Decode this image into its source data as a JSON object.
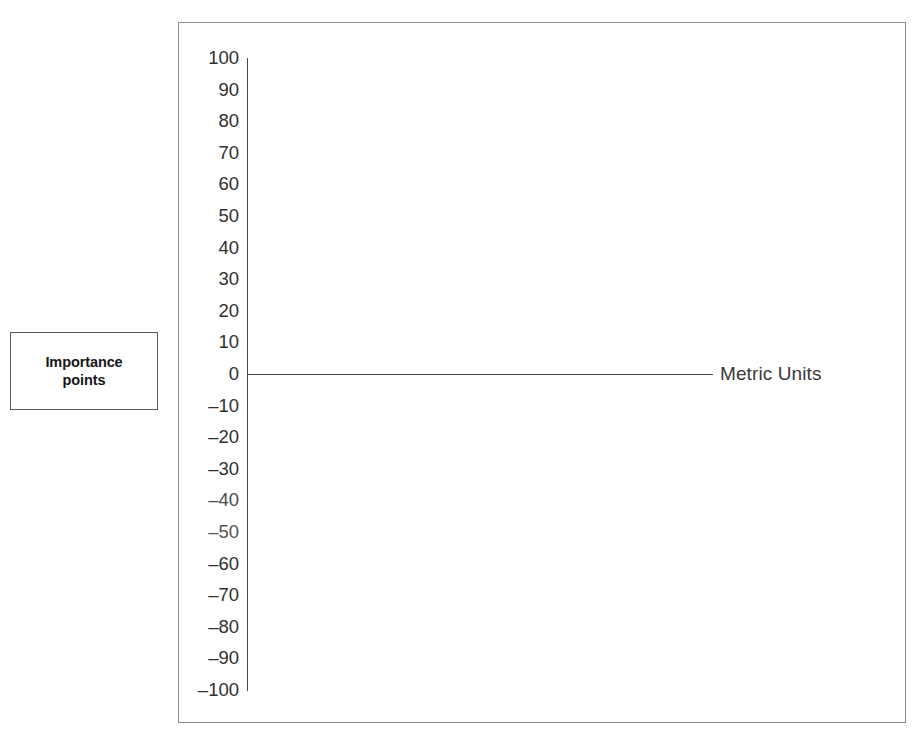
{
  "axis_title": {
    "line1": "Importance",
    "line2": "points"
  },
  "series_label": "Metric Units",
  "chart_data": {
    "type": "line",
    "title": "",
    "subtitle": "",
    "xlabel": "",
    "ylabel": "Importance points",
    "ylim": [
      -100,
      100
    ],
    "grid": false,
    "legend_position": "right-inline",
    "y_ticks": [
      100,
      90,
      80,
      70,
      60,
      50,
      40,
      30,
      20,
      10,
      0,
      -10,
      -20,
      -30,
      -40,
      -50,
      -60,
      -70,
      -80,
      -90,
      -100
    ],
    "y_tick_labels": [
      "100",
      "90",
      "80",
      "70",
      "60",
      "50",
      "40",
      "30",
      "20",
      "10",
      "0",
      "–10",
      "–20",
      "–30",
      "–40",
      "–50",
      "–60",
      "–70",
      "–80",
      "–90",
      "–100"
    ],
    "series": [
      {
        "name": "Metric Units",
        "x": [
          0,
          1
        ],
        "values": [
          0,
          0
        ],
        "color": "#4a4a4a",
        "note": "flat baseline drawn at y = 0 across the plot; no data markers rendered"
      }
    ],
    "annotations": [
      {
        "text": "Metric Units",
        "attached_to": "baseline-right-end"
      }
    ],
    "colors": {
      "axis": "#4a4a4a",
      "frame": "#8c8c8c",
      "text": "#2f2f2f",
      "background": "#ffffff"
    }
  }
}
